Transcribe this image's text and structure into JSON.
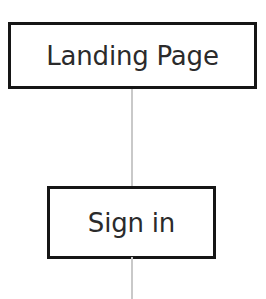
{
  "diagram": {
    "type": "flow-diagram",
    "canvas": {
      "width": 266,
      "height": 299,
      "background_color": "#ffffff"
    },
    "style": {
      "node_border_color": "#161616",
      "node_border_width": 3,
      "node_fill_color": "#ffffff",
      "label_color": "#2b2b2b",
      "connector_color": "#c9c9c9",
      "connector_width": 2
    },
    "nodes": [
      {
        "id": "landing-page",
        "label": "Landing Page",
        "shape": "rectangle",
        "x": 8,
        "y": 22,
        "width": 249,
        "height": 67
      },
      {
        "id": "sign-in",
        "label": "Sign in",
        "shape": "rectangle",
        "x": 47,
        "y": 186,
        "width": 169,
        "height": 73
      }
    ],
    "connectors": [
      {
        "id": "landing-page-to-sign-in",
        "from": "landing-page",
        "to": "sign-in",
        "orientation": "vertical",
        "x": 131,
        "style": "solid",
        "arrowhead": "none"
      }
    ]
  }
}
